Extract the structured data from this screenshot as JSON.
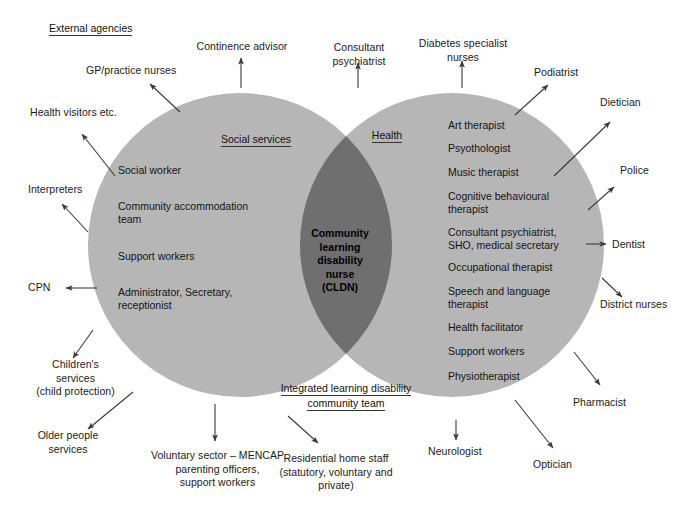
{
  "diagram": {
    "type": "venn-2-circle",
    "title_note": "External agencies",
    "colors": {
      "left_circle": "#b6b6b6",
      "right_circle": "#b6b6b6",
      "overlap": "#6f6f6f",
      "background": "#ffffff",
      "text": "#1a1a1a",
      "arrow": "#3a3a3a"
    }
  },
  "external_agencies_label": "External agencies",
  "circles": {
    "left": {
      "heading": "Social services",
      "entries": [
        "Social worker",
        "Community accommodation\nteam",
        "Support workers",
        "Administrator, Secretary,\nreceptionist"
      ]
    },
    "right": {
      "heading": "Health",
      "entries": [
        "Art therapist",
        "Psyothologist",
        "Music therapist",
        "Cognitive behavioural\ntherapist",
        "Consultant psychiatrist,\nSHO, medical secretary",
        "Occupational therapist",
        "Speech and language\ntherapist",
        "Health facilitator",
        "Support workers",
        "Physiotherapist"
      ]
    },
    "overlap": {
      "label": "Community\nlearning\ndisability\nnurse\n(CLDN)"
    }
  },
  "bottom_heading": "Integrated learning disability\ncommunity team",
  "external_labels": [
    {
      "key": "gp-practice-nurses",
      "text": "GP/practice nurses"
    },
    {
      "key": "health-visitors",
      "text": "Health visitors etc."
    },
    {
      "key": "interpreters",
      "text": "Interpreters"
    },
    {
      "key": "cpn",
      "text": "CPN"
    },
    {
      "key": "childrens-services",
      "text": "Children's\nservices\n(child protection)"
    },
    {
      "key": "older-people-services",
      "text": "Older people\nservices"
    },
    {
      "key": "voluntary-sector",
      "text": "Voluntary sector – MENCAP\nparenting officers,\nsupport workers"
    },
    {
      "key": "residential-home-staff",
      "text": "Residential home staff\n(statutory, voluntary and\nprivate)"
    },
    {
      "key": "continence-advisor",
      "text": "Continence advisor"
    },
    {
      "key": "consultant-psychiatrist",
      "text": "Consultant\npsychiatrist"
    },
    {
      "key": "diabetes-nurses",
      "text": "Diabetes specialist\nnurses"
    },
    {
      "key": "podiatrist",
      "text": "Podiatrist"
    },
    {
      "key": "dietician",
      "text": "Dietician"
    },
    {
      "key": "police",
      "text": "Police"
    },
    {
      "key": "dentist",
      "text": "Dentist"
    },
    {
      "key": "district-nurses",
      "text": "District nurses"
    },
    {
      "key": "pharmacist",
      "text": "Pharmacist"
    },
    {
      "key": "optician",
      "text": "Optician"
    },
    {
      "key": "neurologist",
      "text": "Neurologist"
    }
  ]
}
